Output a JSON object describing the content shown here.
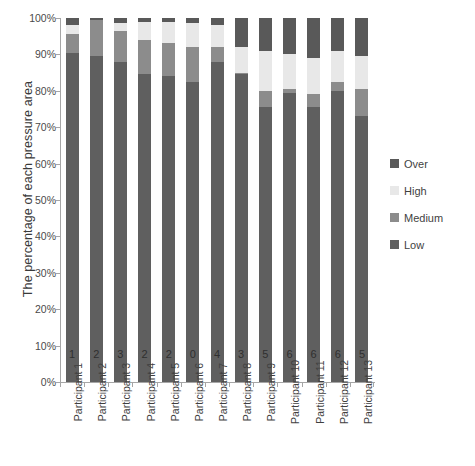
{
  "chart_data": {
    "type": "bar",
    "subtype": "stacked-100-percent",
    "title": "",
    "xlabel": "",
    "ylabel": "The percentage of each pressure area",
    "ylim": [
      0,
      100
    ],
    "ytick_labels": [
      "100%",
      "90%",
      "80%",
      "70%",
      "60%",
      "50%",
      "40%",
      "30%",
      "20%",
      "10%",
      "0%"
    ],
    "ytick_values": [
      100,
      90,
      80,
      70,
      60,
      50,
      40,
      30,
      20,
      10,
      0
    ],
    "grid": false,
    "legend_position": "right",
    "categories": [
      "Participant 1",
      "Participant 2",
      "Participant 3",
      "Participant 4",
      "Participant 5",
      "Participant 6",
      "Participant 7",
      "Participant 8",
      "Participant 9",
      "Participant 10",
      "Participant 11",
      "Participant 12",
      "Participant 13"
    ],
    "series": [
      {
        "name": "Low",
        "color": "#5f5f5f",
        "values": [
          90.5,
          89.5,
          88.0,
          84.5,
          84.0,
          82.5,
          88.0,
          84.5,
          75.5,
          79.5,
          75.5,
          80.0,
          73.0
        ]
      },
      {
        "name": "Medium",
        "color": "#8c8c8c",
        "values": [
          5.0,
          10.0,
          8.5,
          9.5,
          9.0,
          9.5,
          4.0,
          0.5,
          4.5,
          1.0,
          3.5,
          2.5,
          7.5
        ]
      },
      {
        "name": "High",
        "color": "#e8e8e8",
        "values": [
          2.5,
          0.0,
          2.0,
          5.0,
          6.0,
          6.5,
          6.0,
          7.0,
          11.0,
          9.5,
          10.0,
          8.5,
          9.0
        ]
      },
      {
        "name": "Over",
        "color": "#595959",
        "values": [
          2.0,
          0.5,
          1.5,
          1.0,
          1.0,
          1.5,
          2.0,
          8.0,
          9.0,
          10.0,
          11.0,
          9.0,
          10.5
        ]
      }
    ],
    "bar_value_labels": [
      "1",
      "2",
      "3",
      "2",
      "2",
      "0",
      "4",
      "3",
      "5",
      "6",
      "6",
      "6",
      "5"
    ]
  },
  "legend": {
    "entries": [
      {
        "label": "Over",
        "color": "#595959"
      },
      {
        "label": "High",
        "color": "#e8e8e8"
      },
      {
        "label": "Medium",
        "color": "#8c8c8c"
      },
      {
        "label": "Low",
        "color": "#5f5f5f"
      }
    ]
  },
  "colors": {
    "axis": "#a6a6a6",
    "text": "#3f3f3f",
    "background": "#ffffff"
  }
}
